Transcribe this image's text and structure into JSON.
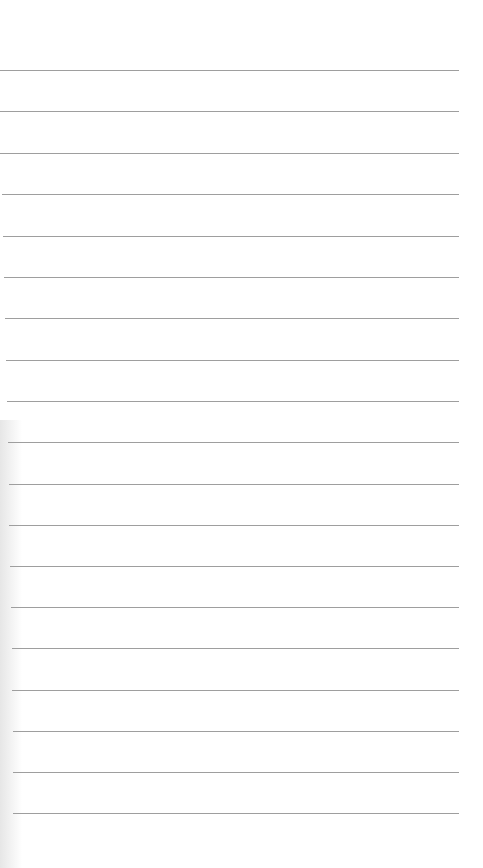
{
  "page": {
    "type": "lined-paper",
    "background_color": "#ffffff",
    "rule_color": "#9e9e9e",
    "rules": [
      {
        "y": 70,
        "x1": 0,
        "x2": 459
      },
      {
        "y": 111,
        "x1": 0,
        "x2": 459
      },
      {
        "y": 153,
        "x1": 0,
        "x2": 459
      },
      {
        "y": 194,
        "x1": 2,
        "x2": 459
      },
      {
        "y": 236,
        "x1": 3,
        "x2": 459
      },
      {
        "y": 277,
        "x1": 4,
        "x2": 459
      },
      {
        "y": 318,
        "x1": 5,
        "x2": 459
      },
      {
        "y": 360,
        "x1": 6,
        "x2": 459
      },
      {
        "y": 401,
        "x1": 7,
        "x2": 459
      },
      {
        "y": 442,
        "x1": 8,
        "x2": 459
      },
      {
        "y": 484,
        "x1": 9,
        "x2": 459
      },
      {
        "y": 525,
        "x1": 9,
        "x2": 459
      },
      {
        "y": 566,
        "x1": 10,
        "x2": 459
      },
      {
        "y": 607,
        "x1": 11,
        "x2": 459
      },
      {
        "y": 648,
        "x1": 12,
        "x2": 459
      },
      {
        "y": 690,
        "x1": 12,
        "x2": 459
      },
      {
        "y": 731,
        "x1": 13,
        "x2": 459
      },
      {
        "y": 772,
        "x1": 13,
        "x2": 459
      },
      {
        "y": 813,
        "x1": 13,
        "x2": 459
      }
    ]
  }
}
